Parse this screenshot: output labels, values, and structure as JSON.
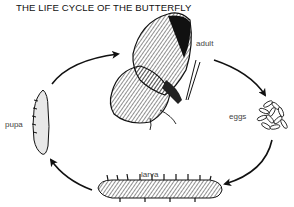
{
  "title": "THE LIFE CYCLE OF THE BUTTERFLY",
  "stages": [
    {
      "id": "adult",
      "label": "adult"
    },
    {
      "id": "eggs",
      "label": "eggs"
    },
    {
      "id": "larva",
      "label": "larva"
    },
    {
      "id": "pupa",
      "label": "pupa"
    }
  ],
  "cycle_order": [
    "adult",
    "eggs",
    "larva",
    "pupa",
    "adult"
  ],
  "colors": {
    "ink": "#111111",
    "label": "#444444",
    "background": "#ffffff"
  }
}
